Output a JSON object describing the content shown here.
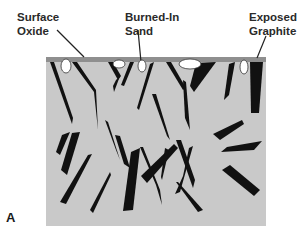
{
  "labels": {
    "surface_oxide": [
      "Surface",
      "Oxide"
    ],
    "burned_in_sand": [
      "Burned-In",
      "Sand"
    ],
    "exposed_graphite": [
      "Exposed",
      "Graphite"
    ]
  },
  "panel_letter": "A",
  "colors": {
    "matrix": "#c9c9c9",
    "oxide_layer": "#8f8f8f",
    "graphite": "#111111",
    "sand": "#ffffff",
    "text": "#2a2a2a"
  }
}
